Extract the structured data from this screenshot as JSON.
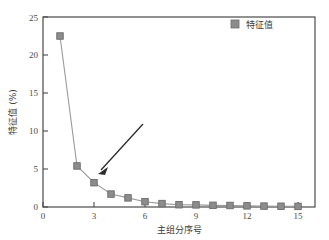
{
  "chart_data": {
    "type": "line",
    "title": "",
    "subtitle": "",
    "xlabel": "主组分序号",
    "ylabel": "特征值 (%)",
    "x": [
      1,
      2,
      3,
      4,
      5,
      6,
      7,
      8,
      9,
      10,
      11,
      12,
      13,
      14,
      15
    ],
    "series": [
      {
        "name": "特征值",
        "values": [
          22.5,
          5.4,
          3.2,
          1.7,
          1.2,
          0.7,
          0.45,
          0.3,
          0.28,
          0.22,
          0.2,
          0.15,
          0.12,
          0.1,
          0.08
        ]
      }
    ],
    "xlim": [
      0,
      16
    ],
    "ylim": [
      0,
      25
    ],
    "xticks": [
      0,
      3,
      6,
      9,
      12,
      15
    ],
    "yticks": [
      0,
      5,
      10,
      15,
      20,
      25
    ],
    "grid": false,
    "legend_position": "top-right",
    "marker": "square",
    "annotations": [
      {
        "type": "arrow",
        "label": "",
        "points_to_x": 3,
        "points_to_y": 3.2
      }
    ],
    "colors": {
      "marker_fill": "#8c8c8c",
      "marker_edge": "#6b6b6b",
      "line": "#9a9a9a",
      "axis": "#4a4a4a",
      "annotation_arrow": "#2b2b2b",
      "background": "#ffffff"
    }
  },
  "axes": {
    "y_tick_labels": [
      "0",
      "5",
      "10",
      "15",
      "20",
      "25"
    ],
    "x_tick_labels": [
      "0",
      "3",
      "6",
      "9",
      "12",
      "15"
    ],
    "x_axis_title": "主组分序号",
    "y_axis_title": "特征值 (%)"
  },
  "legend": {
    "entries": [
      {
        "label": "特征值",
        "marker": "square-marker",
        "color": "#8c8c8c"
      }
    ]
  }
}
